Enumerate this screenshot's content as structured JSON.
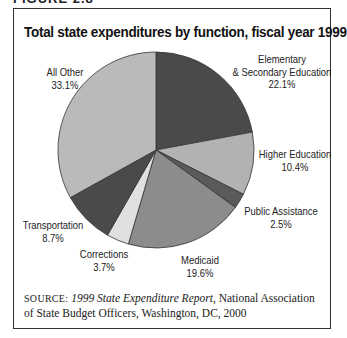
{
  "figure": {
    "label": "FIGURE 2.8",
    "title": "Total state expenditures by function, fiscal year 1999",
    "source_prefix": "SOURCE:",
    "source_title": "1999 State Expenditure Report",
    "source_rest": ", National Association of State Budget Officers, Washington, DC, 2000"
  },
  "labels": {
    "elem": {
      "line1": "Elementary",
      "line2": "& Secondary Education",
      "pct": "22.1%"
    },
    "higher": {
      "line1": "Higher Education",
      "pct": "10.4%"
    },
    "public": {
      "line1": "Public Assistance",
      "pct": "2.5%"
    },
    "medicaid": {
      "line1": "Medicaid",
      "pct": "19.6%"
    },
    "corrections": {
      "line1": "Corrections",
      "pct": "3.7%"
    },
    "transport": {
      "line1": "Transportation",
      "pct": "8.7%"
    },
    "other": {
      "line1": "All Other",
      "pct": "33.1%"
    }
  },
  "chart_data": {
    "type": "pie",
    "title": "Total state expenditures by function, fiscal year 1999",
    "categories": [
      "Elementary & Secondary Education",
      "Higher Education",
      "Public Assistance",
      "Medicaid",
      "Corrections",
      "Transportation",
      "All Other"
    ],
    "values": [
      22.1,
      10.4,
      2.5,
      19.6,
      3.7,
      8.7,
      33.1
    ],
    "colors": [
      "#4a4a4a",
      "#b2b2b2",
      "#5a5a5a",
      "#8c8c8c",
      "#e0e0e0",
      "#4a4a4a",
      "#bababa"
    ],
    "start_angle": "12 o'clock, clockwise",
    "unit": "%",
    "source": "1999 State Expenditure Report, National Association of State Budget Officers, Washington, DC, 2000"
  }
}
